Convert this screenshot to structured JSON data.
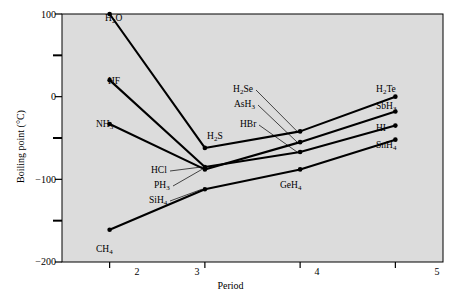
{
  "chart_data": {
    "type": "line",
    "title": "",
    "xlabel": "Period",
    "ylabel": "Boiling point (°C)",
    "xlim": [
      1.5,
      5.5
    ],
    "ylim": [
      -200,
      100
    ],
    "xticks": [
      2,
      3,
      4,
      5
    ],
    "xtick_labels": [
      "2",
      "3",
      "4",
      "5"
    ],
    "yticks": [
      100,
      50,
      0,
      -50,
      -100,
      -150,
      -200
    ],
    "ytick_labels": [
      "100",
      "",
      "0",
      "",
      "−100",
      "",
      "−200"
    ],
    "ytick_labeled": [
      100,
      0,
      -100,
      -200
    ],
    "grid": false,
    "legend": "none (series labeled inline at endpoints)",
    "x": [
      2,
      3,
      4,
      5
    ],
    "series": [
      {
        "name": "Group 16 hydrides",
        "points": [
          "H2O",
          "H2S",
          "H2Se",
          "H2Te"
        ],
        "values": [
          100,
          -62,
          -42,
          0
        ]
      },
      {
        "name": "Group 17 hydrides",
        "points": [
          "HF",
          "HCl",
          "HBr",
          "HI"
        ],
        "values": [
          20,
          -85,
          -67,
          -35
        ]
      },
      {
        "name": "Group 15 hydrides",
        "points": [
          "NH3",
          "PH3",
          "AsH3",
          "SbH3"
        ],
        "values": [
          -33,
          -88,
          -55,
          -18
        ]
      },
      {
        "name": "Group 14 hydrides",
        "points": [
          "CH4",
          "SiH4",
          "GeH4",
          "SnH4"
        ],
        "values": [
          -161,
          -112,
          -88,
          -52
        ]
      }
    ],
    "annotations": [
      {
        "text": "H2O",
        "period": 2,
        "value": 100,
        "placement": "left"
      },
      {
        "text": "HF",
        "period": 2,
        "value": 20,
        "placement": "left"
      },
      {
        "text": "NH3",
        "period": 2,
        "value": -33,
        "placement": "left"
      },
      {
        "text": "CH4",
        "period": 2,
        "value": -161,
        "placement": "left"
      },
      {
        "text": "H2S",
        "period": 3,
        "value": -62,
        "placement": "upper-right"
      },
      {
        "text": "HCl",
        "period": 3,
        "value": -85,
        "placement": "leader-left"
      },
      {
        "text": "PH3",
        "period": 3,
        "value": -88,
        "placement": "leader-left"
      },
      {
        "text": "SiH4",
        "period": 3,
        "value": -112,
        "placement": "leader-left"
      },
      {
        "text": "H2Se",
        "period": 4,
        "value": -42,
        "placement": "leader-left"
      },
      {
        "text": "AsH3",
        "period": 4,
        "value": -55,
        "placement": "leader-left"
      },
      {
        "text": "HBr",
        "period": 4,
        "value": -67,
        "placement": "leader-left"
      },
      {
        "text": "GeH4",
        "period": 4,
        "value": -88,
        "placement": "below-right"
      },
      {
        "text": "H2Te",
        "period": 5,
        "value": 0,
        "placement": "right"
      },
      {
        "text": "SbH3",
        "period": 5,
        "value": -18,
        "placement": "right"
      },
      {
        "text": "HI",
        "period": 5,
        "value": -35,
        "placement": "right"
      },
      {
        "text": "SnH4",
        "period": 5,
        "value": -52,
        "placement": "right"
      }
    ],
    "colors": {
      "plot_background": "#dcdcdc",
      "line": "#000000",
      "axis": "#000000",
      "text": "#000000",
      "page_background": "#ffffff"
    }
  },
  "axes": {
    "ytick_100": "100",
    "ytick_0": "0",
    "ytick_neg100": "−100",
    "ytick_neg200": "−200",
    "xtick_2": "2",
    "xtick_3": "3",
    "xtick_4": "4",
    "xtick_5": "5",
    "xlabel": "Period",
    "ylabel": "Boiling point (°C)"
  },
  "labels": {
    "h2o": {
      "base": "H",
      "sub1": "2",
      "tail": "O"
    },
    "hf": {
      "full": "HF"
    },
    "nh3": {
      "base": "NH",
      "sub1": "3"
    },
    "ch4": {
      "base": "CH",
      "sub1": "4"
    },
    "h2s": {
      "base": "H",
      "sub1": "2",
      "tail": "S"
    },
    "hcl": {
      "full": "HCl"
    },
    "ph3": {
      "base": "PH",
      "sub1": "3"
    },
    "sih4": {
      "base": "SiH",
      "sub1": "4"
    },
    "h2se": {
      "base": "H",
      "sub1": "2",
      "tail": "Se"
    },
    "ash3": {
      "base": "AsH",
      "sub1": "3"
    },
    "hbr": {
      "full": "HBr"
    },
    "geh4": {
      "base": "GeH",
      "sub1": "4"
    },
    "h2te": {
      "base": "H",
      "sub1": "2",
      "tail": "Te"
    },
    "sbh3": {
      "base": "SbH",
      "sub1": "3"
    },
    "hi": {
      "full": "HI"
    },
    "snh4": {
      "base": "SnH",
      "sub1": "4"
    }
  }
}
